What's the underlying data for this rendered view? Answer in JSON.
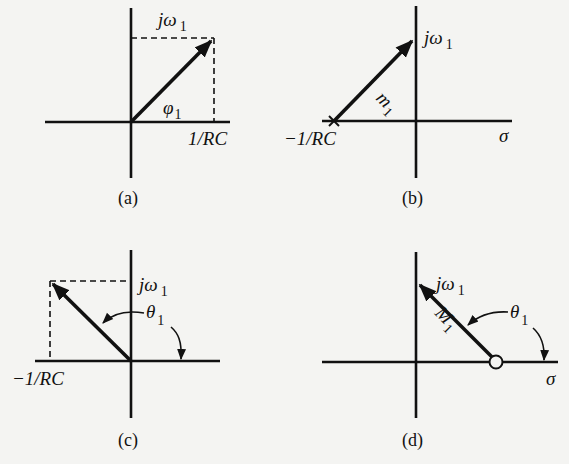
{
  "figure": {
    "panels": [
      {
        "caption": "(a)",
        "vector_angle_label": "φ",
        "vector_angle_sub": "1",
        "imag_label": "jω",
        "imag_sub": "1",
        "real_point_label": "1/RC"
      },
      {
        "caption": "(b)",
        "vector_mag_label": "m",
        "vector_mag_sub": "1",
        "imag_label": "jω",
        "imag_sub": "1",
        "pole_label": "−1/RC",
        "axis_label": "σ",
        "pole_marker": "×"
      },
      {
        "caption": "(c)",
        "angle_label": "θ",
        "angle_sub": "1",
        "imag_label": "jω",
        "imag_sub": "1",
        "real_point_label": "−1/RC"
      },
      {
        "caption": "(d)",
        "vector_mag_label": "M",
        "vector_mag_sub": "1",
        "angle_label": "θ",
        "angle_sub": "1",
        "imag_label": "jω",
        "imag_sub": "1",
        "axis_label": "σ",
        "zero_marker": "○"
      }
    ]
  }
}
